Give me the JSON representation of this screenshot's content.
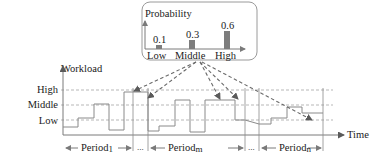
{
  "probability_box": {
    "title": "Probability",
    "bars": [
      {
        "label": "Low",
        "value": "0.1"
      },
      {
        "label": "Middle",
        "value": "0.3"
      },
      {
        "label": "High",
        "value": "0.6"
      }
    ]
  },
  "workload_chart": {
    "y_axis_label": "Workload",
    "x_axis_label": "Time",
    "levels": [
      "High",
      "Middle",
      "Low"
    ],
    "periods": [
      {
        "label": "Period",
        "subscript": "1"
      },
      {
        "label": "Period",
        "subscript": "m"
      },
      {
        "label": "Period",
        "subscript": "n"
      }
    ],
    "ellipsis": [
      "...",
      "..."
    ]
  },
  "colors": {
    "bar": "#7d7d7d",
    "lines": "#8a8a8a",
    "arrows": "#6a6a6a",
    "text": "#1a1a1a"
  }
}
